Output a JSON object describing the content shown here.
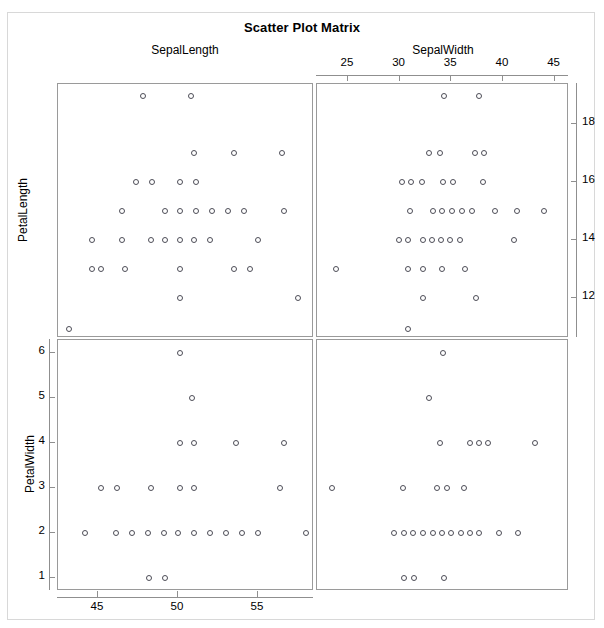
{
  "title": "Scatter Plot Matrix",
  "colors": {
    "background": "#ffffff",
    "frame": "#d8d8d8",
    "panel_border": "#9a9a9a",
    "axis": "#8f8f8f",
    "marker": "#4d4d57",
    "text": "#000000"
  },
  "column_headers": [
    {
      "label": "SepalLength"
    },
    {
      "label": "SepalWidth"
    }
  ],
  "row_labels": [
    {
      "label": "PetalLength"
    },
    {
      "label": "PetalWidth"
    }
  ],
  "axes": {
    "top": {
      "variable": "SepalWidth",
      "ticks": [
        25,
        30,
        35,
        40,
        45
      ],
      "range": [
        22.0,
        46.4
      ],
      "position": "top-right"
    },
    "bottom": {
      "variable": "SepalLength",
      "ticks": [
        45,
        50,
        55
      ],
      "range": [
        42.5,
        58.5
      ],
      "position": "bottom-left"
    },
    "left": {
      "variable": "PetalWidth",
      "ticks": [
        6,
        5,
        4,
        3,
        2,
        1
      ],
      "range": [
        0.72,
        6.3
      ],
      "position": "bottom-left"
    },
    "right": {
      "variable": "PetalLength",
      "ticks": [
        18,
        16,
        14,
        12
      ],
      "range": [
        10.6,
        19.4
      ],
      "position": "top-right"
    }
  },
  "chart_data": {
    "type": "scatter",
    "title": "Scatter Plot Matrix",
    "variables": [
      "SepalLength",
      "SepalWidth",
      "PetalLength",
      "PetalWidth"
    ],
    "grid": false,
    "legend": "none",
    "panels": [
      {
        "id": "panel-0-0",
        "row": 0,
        "col": 0,
        "xvar": "SepalLength",
        "yvar": "PetalLength",
        "xlim": [
          42.5,
          58.5
        ],
        "ylim": [
          10.6,
          19.4
        ],
        "xticks": [
          45,
          50,
          55
        ],
        "yticks": [
          12,
          14,
          16,
          18
        ],
        "points": [
          [
            47.8,
            19.0
          ],
          [
            50.8,
            19.0
          ],
          [
            51.0,
            17.0
          ],
          [
            53.5,
            17.0
          ],
          [
            56.5,
            17.0
          ],
          [
            47.4,
            16.0
          ],
          [
            48.4,
            16.0
          ],
          [
            50.1,
            16.0
          ],
          [
            51.1,
            16.0
          ],
          [
            46.5,
            15.0
          ],
          [
            49.2,
            15.0
          ],
          [
            50.1,
            15.0
          ],
          [
            51.1,
            15.0
          ],
          [
            52.1,
            15.0
          ],
          [
            53.1,
            15.0
          ],
          [
            54.1,
            15.0
          ],
          [
            56.6,
            15.0
          ],
          [
            44.6,
            14.0
          ],
          [
            46.5,
            14.0
          ],
          [
            48.3,
            14.0
          ],
          [
            49.2,
            14.0
          ],
          [
            50.1,
            14.0
          ],
          [
            51.0,
            14.0
          ],
          [
            52.0,
            14.0
          ],
          [
            55.0,
            14.0
          ],
          [
            44.6,
            13.0
          ],
          [
            45.2,
            13.0
          ],
          [
            46.7,
            13.0
          ],
          [
            50.1,
            13.0
          ],
          [
            53.5,
            13.0
          ],
          [
            54.5,
            13.0
          ],
          [
            50.1,
            12.0
          ],
          [
            57.5,
            12.0
          ],
          [
            43.2,
            10.9
          ]
        ]
      },
      {
        "id": "panel-0-1",
        "row": 0,
        "col": 1,
        "xvar": "SepalWidth",
        "yvar": "PetalLength",
        "xlim": [
          22.0,
          46.4
        ],
        "ylim": [
          10.6,
          19.4
        ],
        "xticks": [
          25,
          30,
          35,
          40,
          45
        ],
        "yticks": [
          12,
          14,
          16,
          18
        ],
        "points": [
          [
            34.3,
            19.0
          ],
          [
            37.7,
            19.0
          ],
          [
            32.8,
            17.0
          ],
          [
            33.9,
            17.0
          ],
          [
            37.3,
            17.0
          ],
          [
            38.2,
            17.0
          ],
          [
            30.2,
            16.0
          ],
          [
            31.1,
            16.0
          ],
          [
            32.2,
            16.0
          ],
          [
            34.2,
            16.0
          ],
          [
            35.2,
            16.0
          ],
          [
            38.1,
            16.0
          ],
          [
            31.0,
            15.0
          ],
          [
            33.2,
            15.0
          ],
          [
            34.1,
            15.0
          ],
          [
            35.1,
            15.0
          ],
          [
            36.0,
            15.0
          ],
          [
            37.0,
            15.0
          ],
          [
            39.2,
            15.0
          ],
          [
            41.4,
            15.0
          ],
          [
            44.0,
            15.0
          ],
          [
            29.9,
            14.0
          ],
          [
            30.8,
            14.0
          ],
          [
            32.3,
            14.0
          ],
          [
            33.1,
            14.0
          ],
          [
            34.0,
            14.0
          ],
          [
            34.9,
            14.0
          ],
          [
            35.8,
            14.0
          ],
          [
            41.1,
            14.0
          ],
          [
            23.8,
            13.0
          ],
          [
            30.8,
            13.0
          ],
          [
            32.3,
            13.0
          ],
          [
            34.1,
            13.0
          ],
          [
            36.3,
            13.0
          ],
          [
            32.3,
            12.0
          ],
          [
            37.4,
            12.0
          ],
          [
            30.8,
            10.9
          ]
        ]
      },
      {
        "id": "panel-1-0",
        "row": 1,
        "col": 0,
        "xvar": "SepalLength",
        "yvar": "PetalWidth",
        "xlim": [
          42.5,
          58.5
        ],
        "ylim": [
          0.72,
          6.3
        ],
        "xticks": [
          45,
          50,
          55
        ],
        "yticks": [
          1,
          2,
          3,
          4,
          5,
          6
        ],
        "points": [
          [
            50.1,
            6.0
          ],
          [
            50.9,
            5.0
          ],
          [
            50.1,
            4.0
          ],
          [
            51.0,
            4.0
          ],
          [
            53.6,
            4.0
          ],
          [
            56.6,
            4.0
          ],
          [
            45.2,
            3.0
          ],
          [
            46.2,
            3.0
          ],
          [
            48.3,
            3.0
          ],
          [
            50.1,
            3.0
          ],
          [
            51.0,
            3.0
          ],
          [
            56.4,
            3.0
          ],
          [
            44.2,
            2.0
          ],
          [
            46.1,
            2.0
          ],
          [
            47.1,
            2.0
          ],
          [
            48.1,
            2.0
          ],
          [
            49.1,
            2.0
          ],
          [
            50.0,
            2.0
          ],
          [
            51.0,
            2.0
          ],
          [
            52.0,
            2.0
          ],
          [
            53.0,
            2.0
          ],
          [
            54.0,
            2.0
          ],
          [
            55.0,
            2.0
          ],
          [
            58.0,
            2.0
          ],
          [
            48.2,
            1.0
          ],
          [
            49.2,
            1.0
          ]
        ]
      },
      {
        "id": "panel-1-1",
        "row": 1,
        "col": 1,
        "xvar": "SepalWidth",
        "yvar": "PetalWidth",
        "xlim": [
          22.0,
          46.4
        ],
        "ylim": [
          0.72,
          6.3
        ],
        "xticks": [
          25,
          30,
          35,
          40,
          45
        ],
        "yticks": [
          1,
          2,
          3,
          4,
          5,
          6
        ],
        "points": [
          [
            34.2,
            6.0
          ],
          [
            32.8,
            5.0
          ],
          [
            33.9,
            4.0
          ],
          [
            36.8,
            4.0
          ],
          [
            37.7,
            4.0
          ],
          [
            38.6,
            4.0
          ],
          [
            43.1,
            4.0
          ],
          [
            23.5,
            3.0
          ],
          [
            30.3,
            3.0
          ],
          [
            33.6,
            3.0
          ],
          [
            34.6,
            3.0
          ],
          [
            36.2,
            3.0
          ],
          [
            29.5,
            2.0
          ],
          [
            30.4,
            2.0
          ],
          [
            31.3,
            2.0
          ],
          [
            32.3,
            2.0
          ],
          [
            33.2,
            2.0
          ],
          [
            34.1,
            2.0
          ],
          [
            35.0,
            2.0
          ],
          [
            35.9,
            2.0
          ],
          [
            36.8,
            2.0
          ],
          [
            37.7,
            2.0
          ],
          [
            39.6,
            2.0
          ],
          [
            41.5,
            2.0
          ],
          [
            30.4,
            1.0
          ],
          [
            31.4,
            1.0
          ],
          [
            34.3,
            1.0
          ]
        ]
      }
    ]
  }
}
